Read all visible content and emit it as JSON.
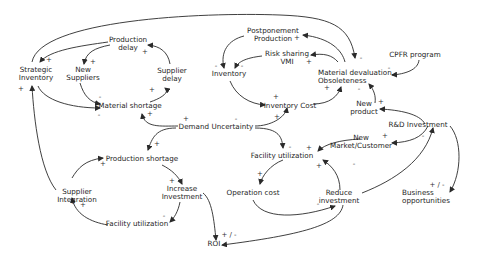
{
  "diagram": {
    "type": "causal-loop",
    "colors": {
      "line": "#2a2a2a",
      "text": "#1e1e1e",
      "background": "#ffffff"
    },
    "nodes": {
      "strategic_inventory": "Strategic\nInventory",
      "production_delay": "Production\ndelay",
      "new_suppliers": "New\nSuppliers",
      "supplier_delay": "Supplier\ndelay",
      "material_shortage": "Material shortage",
      "postponement_production": "Postponement\nProduction",
      "risk_sharing_vmi": "Risk sharing\nVMI",
      "inventory": "Inventory",
      "inventory_cost": "Inventory Cost",
      "material_devaluation": "Material devaluation,\nObsoleteness",
      "cpfr_program": "CPFR program",
      "new_product": "New\nproduct",
      "rd_investment": "R&D Investment",
      "new_market_customer": "New\nMarket/Customer",
      "demand_uncertainty": "Demand Uncertainty",
      "facility_utilization_right": "Facility utilization",
      "production_shortage": "Production shortage",
      "increase_investment": "Increase\nInvestment",
      "supplier_integration": "Supplier\nIntegration",
      "facility_utilization_left": "Facility utilization",
      "operation_cost": "Operation cost",
      "reduce_investment": "Reduce\ninvestment",
      "business_opportunities": "Business\nopportunities",
      "roi": "ROI"
    },
    "links": [
      {
        "from": "Material devaluation, Obsoleteness",
        "to": "Strategic Inventory",
        "sign": "-"
      },
      {
        "from": "Production delay",
        "to": "Strategic Inventory",
        "sign": "+"
      },
      {
        "from": "Production delay",
        "to": "New Suppliers",
        "sign": "+"
      },
      {
        "from": "Strategic Inventory",
        "to": "Material shortage",
        "sign": "-"
      },
      {
        "from": "New Suppliers",
        "to": "Material shortage",
        "sign": "-"
      },
      {
        "from": "Material shortage",
        "to": "Supplier delay",
        "sign": "+"
      },
      {
        "from": "Supplier delay",
        "to": "Production delay",
        "sign": "+"
      },
      {
        "from": "Demand Uncertainty",
        "to": "Material shortage",
        "sign": "+"
      },
      {
        "from": "Demand Uncertainty",
        "to": "Production shortage",
        "sign": "+"
      },
      {
        "from": "Demand Uncertainty",
        "to": "Inventory Cost",
        "sign": "+"
      },
      {
        "from": "Demand Uncertainty",
        "to": "Facility utilization",
        "sign": "-"
      },
      {
        "from": "Material devaluation, Obsoleteness",
        "to": "Postponement Production",
        "sign": "+"
      },
      {
        "from": "Material devaluation, Obsoleteness",
        "to": "Risk sharing VMI",
        "sign": "+"
      },
      {
        "from": "Postponement Production",
        "to": "Inventory",
        "sign": "-"
      },
      {
        "from": "Risk sharing VMI",
        "to": "Inventory",
        "sign": "-"
      },
      {
        "from": "Inventory",
        "to": "Inventory Cost",
        "sign": "+"
      },
      {
        "from": "Inventory Cost",
        "to": "Material devaluation, Obsoleteness",
        "sign": "+"
      },
      {
        "from": "CPFR program",
        "to": "Material devaluation, Obsoleteness",
        "sign": "-"
      },
      {
        "from": "New product",
        "to": "Material devaluation, Obsoleteness",
        "sign": "+"
      },
      {
        "from": "R&D Investment",
        "to": "New product",
        "sign": "+"
      },
      {
        "from": "R&D Investment",
        "to": "New Market/Customer",
        "sign": "+"
      },
      {
        "from": "R&D Investment",
        "to": "Business opportunities",
        "sign": "+ / -"
      },
      {
        "from": "New Market/Customer",
        "to": "Facility utilization",
        "sign": "+"
      },
      {
        "from": "Facility utilization",
        "to": "Operation cost",
        "sign": "-"
      },
      {
        "from": "Operation cost",
        "to": "Reduce investment",
        "sign": "+"
      },
      {
        "from": "Reduce investment",
        "to": "Facility utilization",
        "sign": "+"
      },
      {
        "from": "Reduce investment",
        "to": "R&D Investment",
        "sign": "-"
      },
      {
        "from": "Reduce investment",
        "to": "ROI",
        "sign": "+ / -"
      },
      {
        "from": "Production shortage",
        "to": "Increase Investment",
        "sign": "+"
      },
      {
        "from": "Increase Investment",
        "to": "Facility utilization",
        "sign": "-"
      },
      {
        "from": "Increase Investment",
        "to": "ROI",
        "sign": "+ / -"
      },
      {
        "from": "Facility utilization",
        "to": "Supplier Integration",
        "sign": "+"
      },
      {
        "from": "Supplier Integration",
        "to": "Production shortage",
        "sign": "+"
      },
      {
        "from": "Supplier Integration",
        "to": "Strategic Inventory",
        "sign": "+"
      }
    ],
    "signs": [
      "+",
      "-",
      "+ / -"
    ]
  }
}
